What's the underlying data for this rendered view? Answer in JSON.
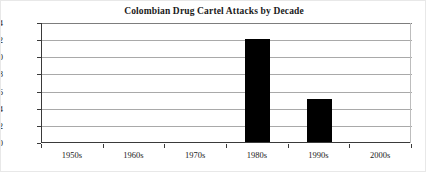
{
  "chart_data": {
    "type": "bar",
    "title": "Colombian Drug Cartel Attacks by Decade",
    "xlabel": "",
    "ylabel": "",
    "categories": [
      "1950s",
      "1960s",
      "1970s",
      "1980s",
      "1990s",
      "2000s"
    ],
    "values": [
      0,
      0,
      0,
      12,
      5,
      0
    ],
    "ylim": [
      0,
      14
    ],
    "ytick_labels": [
      "0",
      "2",
      "4",
      "6",
      "8",
      "10",
      "12",
      "14"
    ],
    "ytick_values": [
      0,
      2,
      4,
      6,
      8,
      10,
      12,
      14
    ],
    "grid": "horizontal",
    "legend": "none",
    "bar_color": "#000000",
    "gridline_color": "#a9a9a9",
    "axis_color": "#3a3a3a",
    "background_color": "#ffffff"
  }
}
